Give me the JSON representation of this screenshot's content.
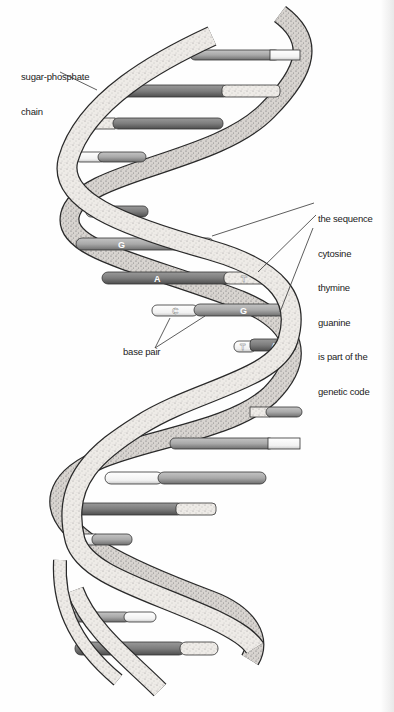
{
  "diagram": {
    "labels": {
      "sugar_phosphate": [
        "sugar-phosphate",
        "chain"
      ],
      "sequence": [
        "the sequence",
        "cytosine",
        "thymine",
        "guanine",
        "is part of the",
        "genetic code"
      ],
      "base_pair": "base pair"
    },
    "base_letters": {
      "pair1_left": "T",
      "pair1_right": "A",
      "pair2_left": "G",
      "pair2_right": "C",
      "pair3_left": "A",
      "pair3_right": "T",
      "pair4_left": "C",
      "pair4_right": "G",
      "pair5_left": "T",
      "pair5_right": "A"
    },
    "colors": {
      "strand_fill": "#ece8e4",
      "strand_outline": "#2a2a2a",
      "base_dark": "#7a7a7a",
      "base_mid": "#a8a8a8",
      "base_light": "#d8d8d8",
      "base_white": "#f6f6f6"
    }
  }
}
